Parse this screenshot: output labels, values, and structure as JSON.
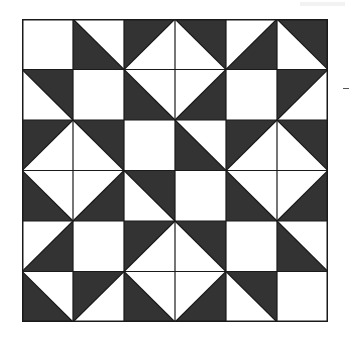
{
  "diagram": {
    "type": "quilt-block-grid",
    "rows": 6,
    "cols": 6,
    "colors": {
      "dark": "#333333",
      "light": "#ffffff",
      "line": "#1a1a1a"
    },
    "cell_legend": {
      "plain": "plain light square",
      "tlbr-bl": "diagonal top-left to bottom-right, dark lower-left half",
      "tlbr-tr": "diagonal top-left to bottom-right, dark upper-right half",
      "bltr-tl": "diagonal bottom-left to top-right, dark upper-left half",
      "bltr-br": "diagonal bottom-left to top-right, dark lower-right half"
    },
    "cells": [
      [
        "plain",
        "tlbr-bl",
        "bltr-tl",
        "tlbr-tr",
        "bltr-br",
        "tlbr-tr"
      ],
      [
        "tlbr-tr",
        "plain",
        "tlbr-bl",
        "bltr-br",
        "plain",
        "bltr-tl"
      ],
      [
        "bltr-tl",
        "tlbr-tr",
        "plain",
        "tlbr-bl",
        "bltr-tl",
        "tlbr-tr"
      ],
      [
        "tlbr-bl",
        "bltr-br",
        "tlbr-tr",
        "plain",
        "tlbr-bl",
        "bltr-br"
      ],
      [
        "bltr-br",
        "plain",
        "bltr-tl",
        "tlbr-tr",
        "plain",
        "tlbr-bl"
      ],
      [
        "tlbr-bl",
        "bltr-tl",
        "tlbr-bl",
        "bltr-br",
        "tlbr-tr",
        "plain"
      ]
    ]
  }
}
